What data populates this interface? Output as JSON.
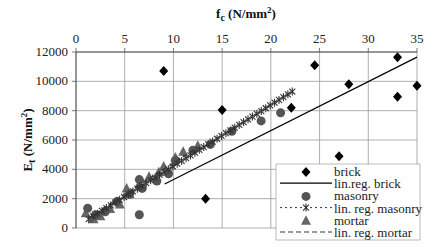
{
  "chart_data": {
    "type": "scatter",
    "title": "",
    "xlabel": "f_c (N/mm²)",
    "xlabel_main": "f",
    "xlabel_sub": "c",
    "xlabel_unit": " (N/mm",
    "xlabel_sup": "2",
    "xlabel_close": ")",
    "ylabel": "E_t (N/mm²)",
    "ylabel_main": "E",
    "ylabel_sub": "t",
    "ylabel_unit": " (N/mm",
    "ylabel_sup": "2",
    "ylabel_close": ")",
    "x_axis_position": "top",
    "xlim": [
      0,
      35
    ],
    "ylim": [
      0,
      12000
    ],
    "xticks": [
      0,
      5,
      10,
      15,
      20,
      25,
      30,
      35
    ],
    "yticks": [
      0,
      2000,
      4000,
      6000,
      8000,
      10000,
      12000
    ],
    "grid": true,
    "legend_position": "lower right",
    "series": [
      {
        "name": "brick",
        "kind": "scatter",
        "marker": "diamond",
        "color": "#000000",
        "points": [
          [
            9.0,
            10700
          ],
          [
            13.3,
            2000
          ],
          [
            15.0,
            8050
          ],
          [
            22.1,
            8200
          ],
          [
            24.5,
            11100
          ],
          [
            27.0,
            4900
          ],
          [
            28.0,
            9800
          ],
          [
            33.0,
            11650
          ],
          [
            33.0,
            8950
          ],
          [
            35.0,
            9700
          ]
        ]
      },
      {
        "name": "lin.reg. brick",
        "kind": "line",
        "style": "solid",
        "color": "#000000",
        "points": [
          [
            9.1,
            3000
          ],
          [
            35.0,
            11650
          ]
        ]
      },
      {
        "name": "masonry",
        "kind": "scatter",
        "marker": "circle",
        "color": "#555555",
        "points": [
          [
            1.2,
            1350
          ],
          [
            2.0,
            900
          ],
          [
            3.0,
            1100
          ],
          [
            4.2,
            1800
          ],
          [
            5.5,
            2300
          ],
          [
            6.5,
            3300
          ],
          [
            6.8,
            2700
          ],
          [
            6.5,
            900
          ],
          [
            8.3,
            3200
          ],
          [
            9.5,
            3700
          ],
          [
            10.2,
            4600
          ],
          [
            12.0,
            5300
          ],
          [
            13.8,
            5700
          ],
          [
            16.0,
            6600
          ],
          [
            19.0,
            7300
          ],
          [
            21.0,
            7850
          ]
        ]
      },
      {
        "name": "lin. reg. masonry",
        "kind": "line",
        "style": "dotted-with-stars",
        "color": "#333333",
        "points": [
          [
            1.3,
            600
          ],
          [
            22.2,
            9300
          ]
        ]
      },
      {
        "name": "mortar",
        "kind": "scatter",
        "marker": "triangle",
        "color": "#666666",
        "points": [
          [
            1.0,
            1000
          ],
          [
            1.8,
            600
          ],
          [
            2.5,
            800
          ],
          [
            3.5,
            1300
          ],
          [
            4.5,
            1600
          ],
          [
            5.2,
            2700
          ],
          [
            5.5,
            2300
          ],
          [
            6.5,
            3000
          ],
          [
            7.5,
            3500
          ],
          [
            8.5,
            3800
          ],
          [
            9.0,
            4200
          ],
          [
            10.2,
            4800
          ],
          [
            11.0,
            5200
          ],
          [
            12.5,
            5600
          ]
        ]
      },
      {
        "name": "lin. reg. mortar",
        "kind": "line",
        "style": "dashed",
        "color": "#333333",
        "points": [
          [
            1.3,
            700
          ],
          [
            12.5,
            5500
          ]
        ]
      }
    ]
  },
  "legend": {
    "items": [
      {
        "label": "brick",
        "symbol": "diamond"
      },
      {
        "label": "lin.reg. brick",
        "symbol": "solid-line"
      },
      {
        "label": "masonry",
        "symbol": "circle"
      },
      {
        "label": "lin. reg. masonry",
        "symbol": "dotted-star-line"
      },
      {
        "label": "mortar",
        "symbol": "triangle"
      },
      {
        "label": "lin. reg. mortar",
        "symbol": "dashed-line"
      }
    ]
  }
}
